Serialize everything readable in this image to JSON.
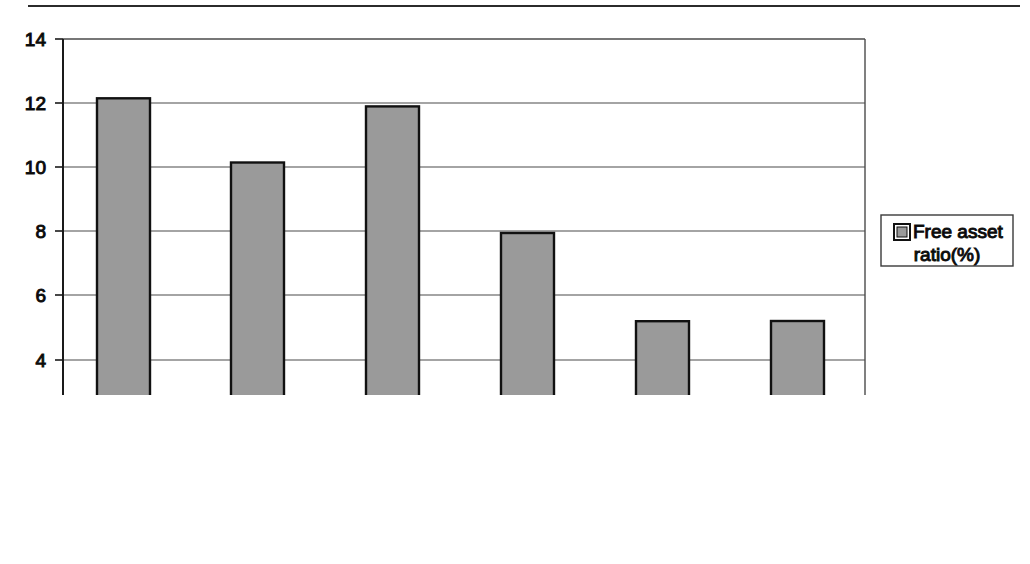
{
  "chart_data": {
    "type": "bar",
    "title": "",
    "categories": [
      "1997",
      "1998",
      "1999",
      "2000",
      "2001",
      "2002"
    ],
    "values": [
      12.3,
      12.15,
      10.15,
      11.9,
      7.95,
      5.2
    ],
    "series": [
      {
        "name": "Free asset ratio(%)",
        "values": [
          12.3,
          12.15,
          10.15,
          11.9,
          7.95,
          5.2
        ]
      }
    ],
    "xlabel": "Years (1997–2002)",
    "ylabel": "",
    "ylim": [
      0,
      14
    ],
    "ytick_labels": [
      "0",
      "2",
      "4",
      "6",
      "8",
      "10",
      "12",
      "14"
    ],
    "ytick_values": [
      0,
      2,
      4,
      6,
      8,
      10,
      12,
      14
    ],
    "grid": true,
    "legend_position": "right",
    "legend_entries": [
      "Free asset ratio(%)"
    ],
    "bar_fill_color": "#9a9a9a",
    "bar_edge_color": "#111111"
  },
  "legend": {
    "label_line1": "Free asset",
    "label_line2": "ratio(%)",
    "swatch_color": "#9a9a9a"
  },
  "axis": {
    "x_title": "Years (1997–2002)"
  },
  "ticks": {
    "y": {
      "t0": "0",
      "t1": "2",
      "t2": "4",
      "t3": "6",
      "t4": "8",
      "t5": "10",
      "t6": "12",
      "t7": "14"
    },
    "x": {
      "c0": "1997",
      "c1": "1998",
      "c2": "1999",
      "c3": "2000",
      "c4": "2001",
      "c5": "2002"
    }
  }
}
